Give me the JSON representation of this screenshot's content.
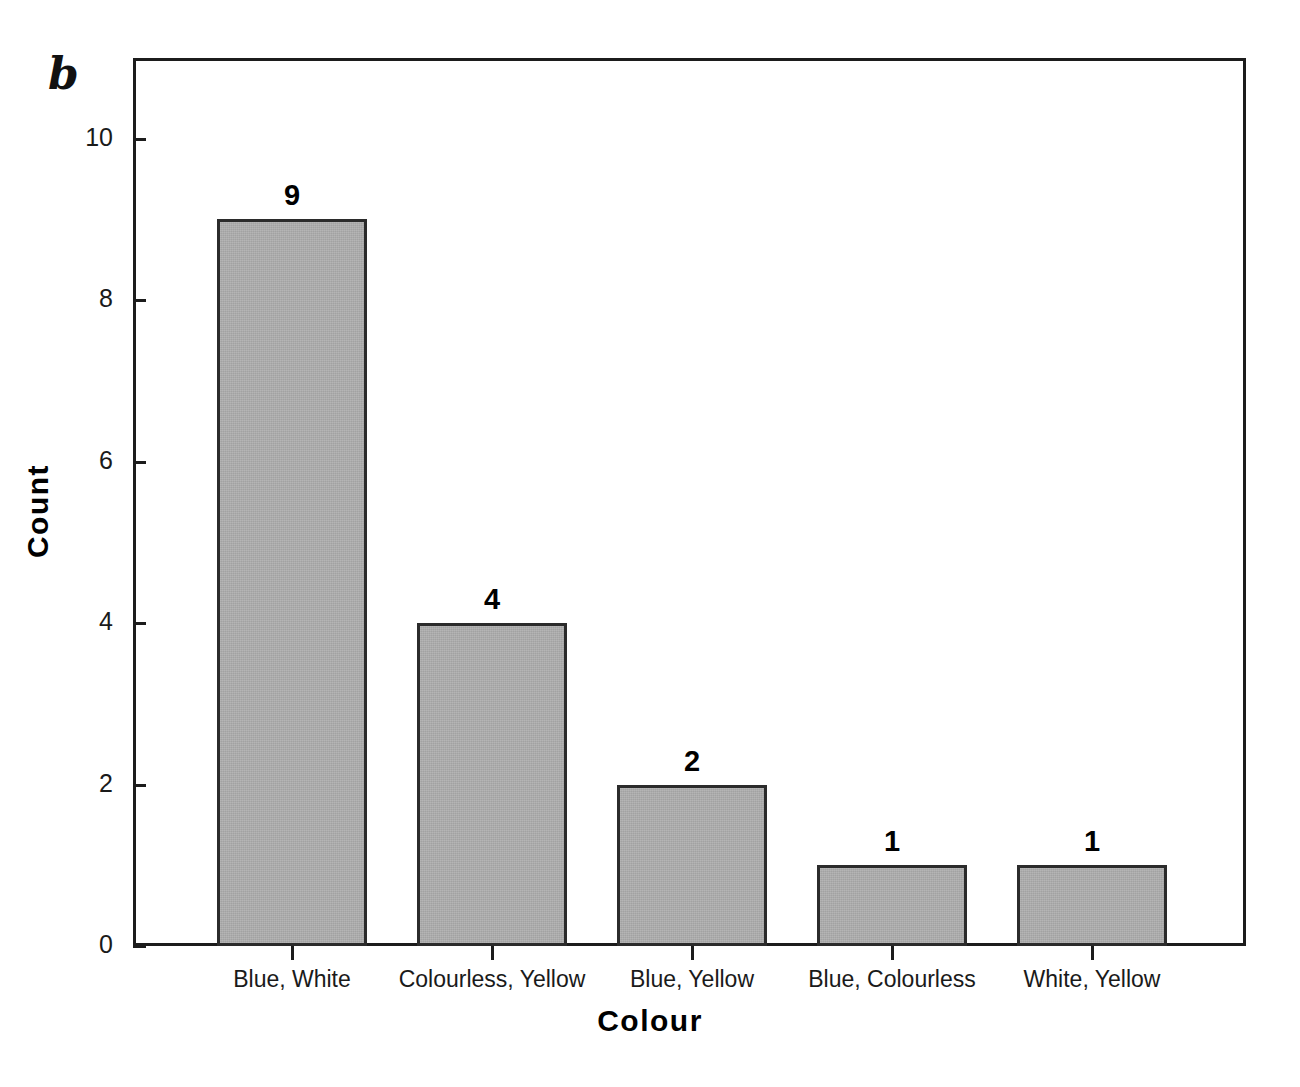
{
  "figure": {
    "panel_label": "b"
  },
  "chart_data": {
    "type": "bar",
    "title": "",
    "subtitle": "",
    "xlabel": "Colour",
    "ylabel": "Count",
    "categories": [
      "Blue, White",
      "Colourless, Yellow",
      "Blue, Yellow",
      "Blue, Colourless",
      "White, Yellow"
    ],
    "values": [
      9,
      4,
      2,
      1,
      1
    ],
    "value_labels": [
      "9",
      "4",
      "2",
      "1",
      "1"
    ],
    "ylim": [
      0,
      11
    ],
    "ytick_values": [
      0,
      2,
      4,
      6,
      8,
      10
    ],
    "ytick_labels": [
      "0",
      "2",
      "4",
      "6",
      "8",
      "10"
    ],
    "grid": false,
    "legend": null,
    "bar_fill_color": "#adadad",
    "bar_border_color": "#2b2b2b",
    "axis_color": "#1c1c1c",
    "background_color": "#ffffff"
  }
}
